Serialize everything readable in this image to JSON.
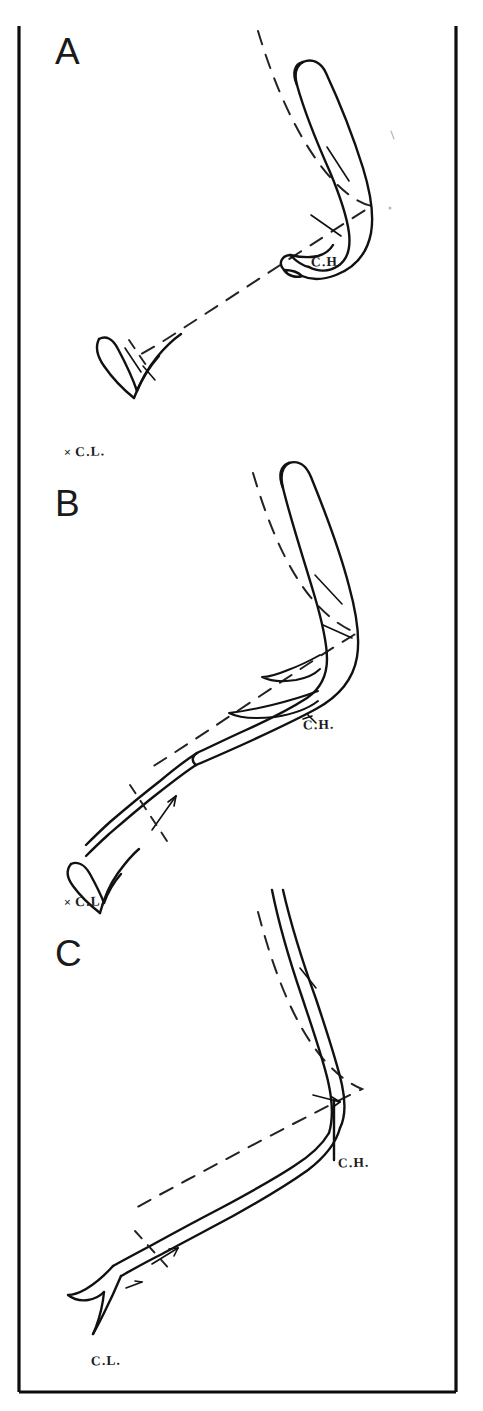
{
  "figure": {
    "kind": "hand-drawn line tracing figure",
    "background_color": "#ffffff",
    "ink_color": "#111111",
    "frame": {
      "present_edges": "left, right, bottom",
      "stroke_color": "#0d0d0d"
    }
  },
  "panels": [
    {
      "id": "A",
      "letter": "A",
      "labels": {
        "ch": "C.H.",
        "cl": "C.L.",
        "cl_prefix": "×"
      },
      "features": {
        "limb_outline": "tapering curved tube, open proximal tip upper right",
        "hook": "V-shaped hook, lower left",
        "reference_line": "dashed chord from upper right to lower left",
        "markers": "short tick crossing limb"
      }
    },
    {
      "id": "B",
      "letter": "B",
      "labels": {
        "ch": "C.H.",
        "cl": "C.L.",
        "cl_prefix": "×"
      },
      "features": {
        "limb_outline": "tapering curved tube, more extended, open proximal tip top",
        "hook": "V-shaped hook, lower left",
        "reference_line": "dashed chord from upper right to lower left",
        "markers": "arrow crossing limb mid-shaft"
      }
    },
    {
      "id": "C",
      "letter": "C",
      "labels": {
        "ch": "C.H.",
        "cl": "C.L."
      },
      "features": {
        "limb_outline": "fully extended slender curved tube",
        "hook": "flared foot, lower left",
        "reference_line": "dashed chord from upper right to lower left",
        "markers": "arrows crossing limb shaft"
      }
    }
  ],
  "label_legend": {
    "ch_full": "C.H.",
    "cl_full": "C.L."
  }
}
